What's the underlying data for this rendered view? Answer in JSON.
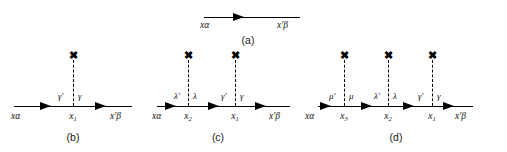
{
  "figure": {
    "line_color": "#000000",
    "background_color": "#ffffff"
  },
  "panels": [
    {
      "id": "a",
      "caption": "(a)",
      "left_endpoint_label": "xα",
      "right_endpoint_label": "x′β",
      "arrow_direction": "left",
      "arrow_count": 1,
      "vertices": []
    },
    {
      "id": "b",
      "caption": "(b)",
      "left_endpoint_label": "xα",
      "right_endpoint_label": "x′β",
      "arrow_direction": "left",
      "arrow_count": 2,
      "vertices": [
        {
          "point_label": "x₁",
          "point_label_base": "x",
          "point_label_sub": "1",
          "left_index": "γ′",
          "right_index": "γ",
          "cross_glyph": "✖"
        }
      ]
    },
    {
      "id": "c",
      "caption": "(c)",
      "left_endpoint_label": "xα",
      "right_endpoint_label": "x′β",
      "arrow_direction": "left",
      "arrow_count": 3,
      "vertices": [
        {
          "point_label": "x₂",
          "point_label_base": "x",
          "point_label_sub": "2",
          "left_index": "λ′",
          "right_index": "λ",
          "cross_glyph": "✖"
        },
        {
          "point_label": "x₁",
          "point_label_base": "x",
          "point_label_sub": "1",
          "left_index": "γ′",
          "right_index": "γ",
          "cross_glyph": "✖"
        }
      ]
    },
    {
      "id": "d",
      "caption": "(d)",
      "left_endpoint_label": "xα",
      "right_endpoint_label": "x′β",
      "arrow_direction": "left",
      "arrow_count": 4,
      "vertices": [
        {
          "point_label": "x₃",
          "point_label_base": "x",
          "point_label_sub": "3",
          "left_index": "μ′",
          "right_index": "μ",
          "cross_glyph": "✖"
        },
        {
          "point_label": "x₂",
          "point_label_base": "x",
          "point_label_sub": "2",
          "left_index": "λ′",
          "right_index": "λ",
          "cross_glyph": "✖"
        },
        {
          "point_label": "x₁",
          "point_label_base": "x",
          "point_label_sub": "1",
          "left_index": "γ′",
          "right_index": "γ",
          "cross_glyph": "✖"
        }
      ]
    }
  ]
}
